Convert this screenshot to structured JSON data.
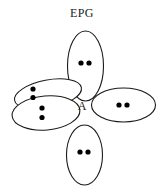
{
  "figure": {
    "title": "EPG",
    "center_atom_label": "A",
    "geometry_name": "square-planar-electron-pair-geometry",
    "colors": {
      "background": "#ffffff",
      "stroke": "#1a1a1a",
      "dot": "#000000",
      "text": "#1b1b1b"
    },
    "lobes": [
      {
        "name": "top-lobe",
        "position": "top",
        "cx": 85.5,
        "cy": 66,
        "rx": 18,
        "ry": 35,
        "rotation": 0,
        "electron_count": 2,
        "dots": [
          {
            "cx": 81,
            "cy": 63
          },
          {
            "cx": 89,
            "cy": 63
          }
        ]
      },
      {
        "name": "upper-left-lobe",
        "position": "upper-left",
        "cx": 48,
        "cy": 94,
        "rx": 34,
        "ry": 14,
        "rotation": -11,
        "electron_count": 2,
        "dots": [
          {
            "cx": 33,
            "cy": 89
          },
          {
            "cx": 33,
            "cy": 97.5
          }
        ]
      },
      {
        "name": "lower-left-lobe",
        "position": "lower-left",
        "cx": 46,
        "cy": 113,
        "rx": 34,
        "ry": 17,
        "rotation": -5,
        "electron_count": 2,
        "dots": [
          {
            "cx": 42,
            "cy": 108
          },
          {
            "cx": 42,
            "cy": 117.5
          }
        ]
      },
      {
        "name": "right-lobe",
        "position": "right",
        "cx": 123.5,
        "cy": 105,
        "rx": 32,
        "ry": 17,
        "rotation": 0,
        "electron_count": 2,
        "dots": [
          {
            "cx": 119,
            "cy": 105
          },
          {
            "cx": 127,
            "cy": 105
          }
        ]
      },
      {
        "name": "bottom-lobe",
        "position": "bottom",
        "cx": 84.5,
        "cy": 155,
        "rx": 18,
        "ry": 30,
        "rotation": 0,
        "electron_count": 2,
        "dots": [
          {
            "cx": 80,
            "cy": 152
          },
          {
            "cx": 88,
            "cy": 152
          }
        ]
      }
    ],
    "center_label_position": {
      "x": 82,
      "y": 110
    },
    "dot_radius": 2.6
  }
}
